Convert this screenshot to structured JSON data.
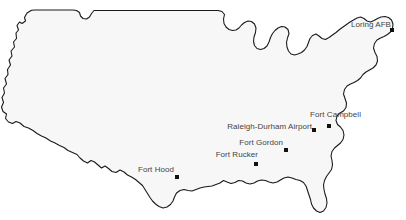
{
  "map": {
    "title": "United States military installations map",
    "region": "Continental United States",
    "background_color": "#ffffff",
    "land_fill_color": "#f7f7f7",
    "outline_color": "#1a1a1a",
    "label_color": "#444444",
    "marker_color": "#111111",
    "width": 406,
    "height": 220
  },
  "sites": [
    {
      "name": "Loring AFB",
      "label": "Loring AFB",
      "dot_x": 392,
      "dot_y": 30,
      "label_x": 391,
      "label_y": 24,
      "label_anchor": "end"
    },
    {
      "name": "Fort Campbell",
      "label": "Fort Campbell",
      "dot_x": 329,
      "dot_y": 126,
      "label_x": 361,
      "label_y": 114,
      "label_anchor": "end"
    },
    {
      "name": "Raleigh-Durham Airport",
      "label": "Raleigh-Durham Airport",
      "dot_x": 314,
      "dot_y": 130,
      "label_x": 312,
      "label_y": 126,
      "label_anchor": "end"
    },
    {
      "name": "Fort Gordon",
      "label": "Fort Gordon",
      "dot_x": 286,
      "dot_y": 150,
      "label_x": 283,
      "label_y": 142,
      "label_anchor": "end"
    },
    {
      "name": "Fort Rucker",
      "label": "Fort Rucker",
      "dot_x": 256,
      "dot_y": 164,
      "label_x": 258,
      "label_y": 154,
      "label_anchor": "end"
    },
    {
      "name": "Fort Hood",
      "label": "Fort Hood",
      "dot_x": 177,
      "dot_y": 177,
      "label_x": 174,
      "label_y": 169,
      "label_anchor": "end"
    }
  ]
}
